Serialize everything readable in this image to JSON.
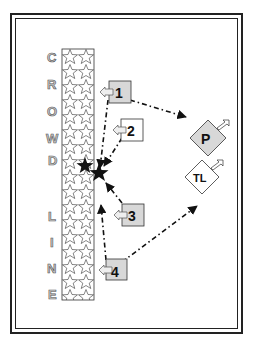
{
  "diagram": {
    "crowd_line_letters": [
      "C",
      "R",
      "O",
      "W",
      "D",
      "",
      "L",
      "I",
      "N",
      "E"
    ],
    "crowd_line_label": "CROWD LINE",
    "players": [
      {
        "label": "1"
      },
      {
        "label": "2"
      },
      {
        "label": "3"
      },
      {
        "label": "4"
      }
    ],
    "targets": [
      {
        "label": "P"
      },
      {
        "label": "TL"
      }
    ],
    "colors": {
      "box_fill": "#d8d8d8",
      "line": "#111111",
      "letter_fill": "#c8c8c8"
    }
  }
}
